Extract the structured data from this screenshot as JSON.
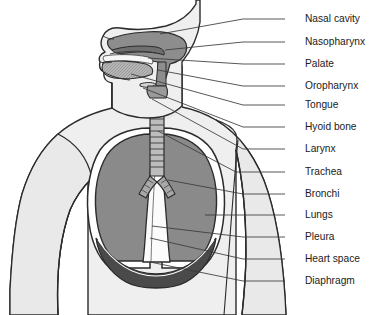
{
  "figure": {
    "background_color": "#ffffff",
    "width": 382,
    "height": 315
  },
  "palette": {
    "body_fill": "#efefef",
    "body_outline": "#2b2b2b",
    "airway_fill": "#8d8d8d",
    "lung_fill": "#8a8a8a",
    "lung_outline": "#2b2b2b",
    "pleura_fill": "#ffffff",
    "diaphragm_fill": "#4a4a4a",
    "heart_space_fill": "#fbfbfb",
    "trachea_fill": "#bdbdbd",
    "leader_line": "#3a3a3a",
    "label_color": "#1b1b1b"
  },
  "labels": [
    {
      "id": "nasal-cavity",
      "text": "Nasal cavity",
      "text_x": 305,
      "text_y": 19,
      "leader": [
        [
          285,
          19
        ],
        [
          243,
          19
        ],
        [
          160,
          34
        ]
      ]
    },
    {
      "id": "nasopharynx",
      "text": "Nasopharynx",
      "text_x": 305,
      "text_y": 42,
      "leader": [
        [
          285,
          42
        ],
        [
          243,
          42
        ],
        [
          165,
          50
        ]
      ]
    },
    {
      "id": "palate",
      "text": "Palate",
      "text_x": 305,
      "text_y": 64,
      "leader": [
        [
          285,
          64
        ],
        [
          243,
          64
        ],
        [
          148,
          58
        ]
      ]
    },
    {
      "id": "oropharynx",
      "text": "Oropharynx",
      "text_x": 305,
      "text_y": 86,
      "leader": [
        [
          285,
          86
        ],
        [
          243,
          86
        ],
        [
          158,
          70
        ]
      ]
    },
    {
      "id": "tongue",
      "text": "Tongue",
      "text_x": 305,
      "text_y": 105,
      "leader": [
        [
          285,
          105
        ],
        [
          243,
          105
        ],
        [
          131,
          74
        ]
      ]
    },
    {
      "id": "hyoid-bone",
      "text": "Hyoid bone",
      "text_x": 305,
      "text_y": 127,
      "leader": [
        [
          285,
          127
        ],
        [
          243,
          127
        ],
        [
          143,
          88
        ]
      ]
    },
    {
      "id": "larynx",
      "text": "Larynx",
      "text_x": 305,
      "text_y": 149,
      "leader": [
        [
          285,
          149
        ],
        [
          243,
          149
        ],
        [
          152,
          99
        ]
      ]
    },
    {
      "id": "trachea",
      "text": "Trachea",
      "text_x": 305,
      "text_y": 172,
      "leader": [
        [
          285,
          172
        ],
        [
          236,
          172
        ],
        [
          158,
          131
        ]
      ]
    },
    {
      "id": "bronchi",
      "text": "Bronchi",
      "text_x": 305,
      "text_y": 194,
      "leader": [
        [
          285,
          194
        ],
        [
          243,
          194
        ],
        [
          168,
          180
        ]
      ]
    },
    {
      "id": "lungs",
      "text": "Lungs",
      "text_x": 305,
      "text_y": 215,
      "leader": [
        [
          285,
          215
        ],
        [
          243,
          215
        ],
        [
          205,
          215
        ]
      ]
    },
    {
      "id": "pleura",
      "text": "Pleura",
      "text_x": 305,
      "text_y": 237,
      "leader": [
        [
          285,
          237
        ],
        [
          243,
          237
        ],
        [
          152,
          226
        ]
      ]
    },
    {
      "id": "heart-space",
      "text": "Heart space",
      "text_x": 305,
      "text_y": 259,
      "leader": [
        [
          285,
          259
        ],
        [
          243,
          259
        ],
        [
          150,
          238
        ]
      ]
    },
    {
      "id": "diaphragm",
      "text": "Diaphragm",
      "text_x": 305,
      "text_y": 281,
      "leader": [
        [
          285,
          281
        ],
        [
          243,
          281
        ],
        [
          150,
          262
        ]
      ]
    }
  ],
  "structures": [
    {
      "id": "head-neck-profile",
      "name": "Head and neck sagittal profile"
    },
    {
      "id": "torso",
      "name": "Thorax and shoulders"
    },
    {
      "id": "left-arm",
      "name": "Left arm"
    },
    {
      "id": "right-arm",
      "name": "Right arm"
    },
    {
      "id": "nasal-airway",
      "name": "Nasal cavity and pharynx airway"
    },
    {
      "id": "tongue-body",
      "name": "Tongue"
    },
    {
      "id": "trachea-tube",
      "name": "Trachea with cartilage rings"
    },
    {
      "id": "left-lung",
      "name": "Left lung"
    },
    {
      "id": "right-lung",
      "name": "Right lung"
    },
    {
      "id": "heart-space-region",
      "name": "Heart space (mediastinum)"
    },
    {
      "id": "diaphragm-dome",
      "name": "Diaphragm"
    }
  ]
}
